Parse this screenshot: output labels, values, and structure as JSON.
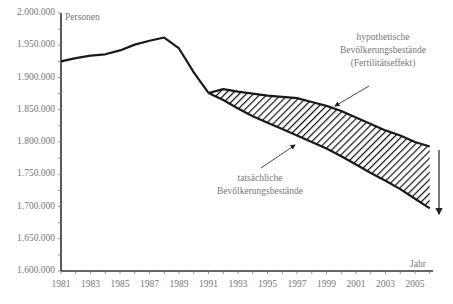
{
  "chart_data": {
    "type": "area",
    "title": "",
    "xlabel": "Jahr",
    "ylabel": "Personen",
    "ylim": [
      1600000,
      2000000
    ],
    "xlim": [
      1981,
      2006
    ],
    "y_ticks": [
      "1.600.000",
      "1.650.000",
      "1.700.000",
      "1.750.000",
      "1.800.000",
      "1.850.000",
      "1.900.000",
      "1.950.000",
      "2.000.000"
    ],
    "y_tick_values": [
      1600000,
      1650000,
      1700000,
      1750000,
      1800000,
      1850000,
      1900000,
      1950000,
      2000000
    ],
    "x_ticks": [
      "1981",
      "1983",
      "1985",
      "1987",
      "1989",
      "1991",
      "1993",
      "1995",
      "1997",
      "1999",
      "2001",
      "2003",
      "2005"
    ],
    "grid": false,
    "series": [
      {
        "name": "Bevölkerungsbestände (bis 1991)",
        "x": [
          1981,
          1982,
          1983,
          1984,
          1985,
          1986,
          1987,
          1988,
          1989,
          1990,
          1991
        ],
        "values": [
          1925000,
          1930000,
          1934000,
          1936000,
          1942000,
          1951000,
          1957000,
          1962000,
          1945000,
          1908000,
          1876000
        ]
      },
      {
        "name": "hypothetische Bevölkerungsbestände (Fertilitätseffekt)",
        "x": [
          1991,
          1992,
          1993,
          1994,
          1995,
          1996,
          1997,
          1998,
          1999,
          2000,
          2001,
          2002,
          2003,
          2004,
          2005,
          2006
        ],
        "values": [
          1876000,
          1882000,
          1878000,
          1875000,
          1872000,
          1870000,
          1868000,
          1862000,
          1856000,
          1848000,
          1838000,
          1828000,
          1818000,
          1810000,
          1800000,
          1793000
        ]
      },
      {
        "name": "tatsächliche Bevölkerungsbestände",
        "x": [
          1991,
          1992,
          1993,
          1994,
          1995,
          1996,
          1997,
          1998,
          1999,
          2000,
          2001,
          2002,
          2003,
          2004,
          2005,
          2006
        ],
        "values": [
          1876000,
          1865000,
          1852000,
          1840000,
          1830000,
          1820000,
          1810000,
          1800000,
          1790000,
          1778000,
          1765000,
          1752000,
          1740000,
          1727000,
          1712000,
          1697000
        ]
      }
    ],
    "fill": {
      "between": [
        "hypothetische Bevölkerungsbestände (Fertilitätseffekt)",
        "tatsächliche Bevölkerungsbestände"
      ],
      "pattern": "diagonal-hatch"
    },
    "annotations": [
      {
        "text": [
          "hypothetische",
          "Bevölkerungsbestände",
          "(Fertilitätseffekt)"
        ],
        "arrow_to": "upper boundary ~1999"
      },
      {
        "text": [
          "tatsächliche",
          "Bevölkerungsbestände"
        ],
        "arrow_to": "lower boundary ~1997"
      },
      {
        "text": [
          "down-arrow"
        ],
        "meaning": "gap at end of period"
      }
    ],
    "legend": "none"
  },
  "labels": {
    "ylabel": "Personen",
    "xlabel": "Jahr",
    "hypo": [
      "hypothetische",
      "Bevölkerungsbestände",
      "(Fertilitätseffekt)"
    ],
    "actual": [
      "tatsächliche",
      "Bevölkerungsbestände"
    ]
  },
  "colors": {
    "line": "#1a1a1a",
    "axis": "#333333",
    "text": "#777777"
  }
}
